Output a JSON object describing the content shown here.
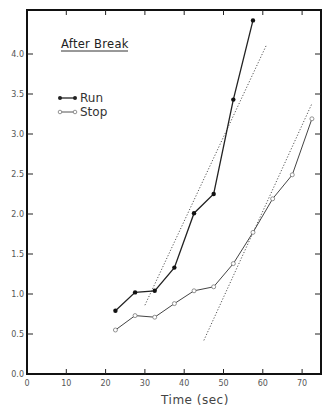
{
  "chart_data": {
    "type": "line",
    "title": "After Break",
    "xlabel": "Time (sec)",
    "ylabel": "",
    "xlim": [
      0,
      75
    ],
    "ylim": [
      0,
      4.5
    ],
    "xticks": [
      0,
      10,
      20,
      30,
      40,
      50,
      60,
      70
    ],
    "xtick_labels": [
      "0",
      "10",
      "20",
      "30",
      "40",
      "50",
      "60",
      "70"
    ],
    "yticks": [
      0.0,
      0.5,
      1.0,
      1.5,
      2.0,
      2.5,
      3.0,
      3.5,
      4.0
    ],
    "ytick_labels": [
      "0.0",
      "0.5",
      "1.0",
      "1.5",
      "2.0",
      "2.5",
      "3.0",
      "3.5",
      "4.0"
    ],
    "grid": false,
    "legend_position": "upper left",
    "series": [
      {
        "name": "Run",
        "marker": "filled-circle",
        "color": "#222222",
        "x": [
          22.5,
          27.5,
          32.5,
          37.5,
          42.5,
          47.5,
          52.5,
          57.5
        ],
        "values": [
          0.79,
          1.02,
          1.04,
          1.33,
          2.01,
          2.25,
          3.43,
          4.42
        ]
      },
      {
        "name": "Stop",
        "marker": "open-circle",
        "color": "#333333",
        "x": [
          22.5,
          27.5,
          32.5,
          37.5,
          42.5,
          47.5,
          52.5,
          57.5,
          62.5,
          67.5,
          72.5
        ],
        "values": [
          0.55,
          0.73,
          0.71,
          0.88,
          1.04,
          1.09,
          1.38,
          1.77,
          2.19,
          2.49,
          3.19
        ]
      }
    ],
    "fit_lines": [
      {
        "for": "Run",
        "style": "dotted",
        "x": [
          30,
          61
        ],
        "y": [
          0.86,
          4.12
        ]
      },
      {
        "for": "Stop",
        "style": "dotted",
        "x": [
          45,
          72.5
        ],
        "y": [
          0.42,
          3.38
        ]
      }
    ]
  },
  "legend": {
    "items": [
      {
        "label": "Run"
      },
      {
        "label": "Stop"
      }
    ]
  }
}
